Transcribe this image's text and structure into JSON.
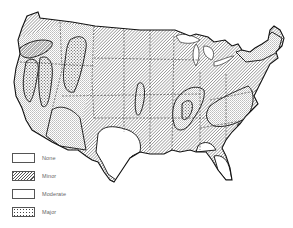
{
  "map": {
    "subject": "Contiguous United States",
    "features": [
      "state boundaries (dashed)",
      "Great Lakes",
      "hazard zone outlines (solid)"
    ]
  },
  "legend": {
    "items": [
      {
        "label": "None",
        "pattern": "blank"
      },
      {
        "label": "Minor",
        "pattern": "diagonal-hatch"
      },
      {
        "label": "Moderate",
        "pattern": "fine-stipple"
      },
      {
        "label": "Major",
        "pattern": "coarse-stipple"
      }
    ]
  },
  "colors": {
    "ink": "#222222",
    "hatch": "#555555",
    "background": "#ffffff"
  }
}
